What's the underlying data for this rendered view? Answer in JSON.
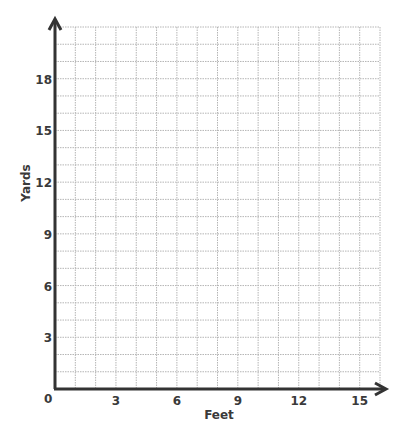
{
  "chart_data": {
    "type": "scatter",
    "title": "",
    "xlabel": "Feet",
    "ylabel": "Yards",
    "xlim": [
      0,
      16
    ],
    "ylim": [
      0,
      21
    ],
    "x_ticks": [
      3,
      6,
      9,
      12,
      15
    ],
    "y_ticks": [
      3,
      6,
      9,
      12,
      15,
      18
    ],
    "origin_label": "0",
    "grid": true,
    "grid_step_x": 1,
    "grid_step_y": 1,
    "series": [],
    "colors": {
      "axis": "#333333",
      "grid": "#b5b5b5",
      "text": "#3a3a3a"
    }
  }
}
